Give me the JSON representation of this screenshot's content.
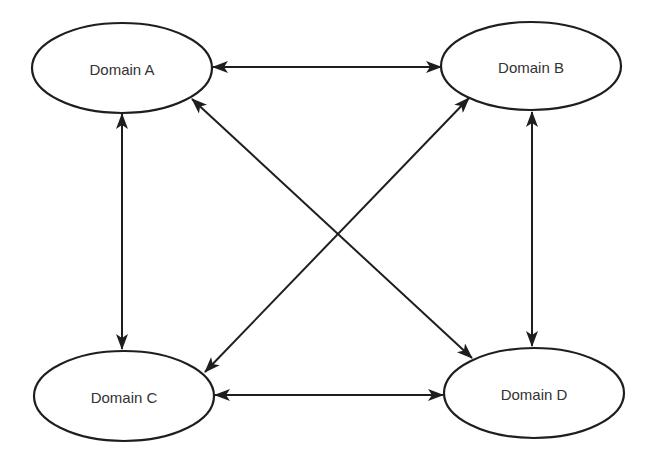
{
  "diagram": {
    "type": "bidirectional network",
    "nodes": [
      {
        "id": "A",
        "label": "Domain A",
        "cx": 122,
        "cy": 68,
        "rx": 90,
        "ry": 45
      },
      {
        "id": "B",
        "label": "Domain B",
        "cx": 531,
        "cy": 66,
        "rx": 90,
        "ry": 44
      },
      {
        "id": "C",
        "label": "Domain C",
        "cx": 124,
        "cy": 396,
        "rx": 90,
        "ry": 45
      },
      {
        "id": "D",
        "label": "Domain D",
        "cx": 534,
        "cy": 393,
        "rx": 90,
        "ry": 45
      }
    ],
    "edges": [
      {
        "from": "A",
        "to": "B",
        "direction": "both",
        "x1": 213,
        "y1": 67,
        "x2": 441,
        "y2": 67
      },
      {
        "from": "A",
        "to": "C",
        "direction": "both",
        "x1": 122,
        "y1": 114,
        "x2": 122,
        "y2": 349
      },
      {
        "from": "B",
        "to": "D",
        "direction": "both",
        "x1": 532,
        "y1": 112,
        "x2": 532,
        "y2": 346
      },
      {
        "from": "C",
        "to": "D",
        "direction": "both",
        "x1": 215,
        "y1": 395,
        "x2": 443,
        "y2": 395
      },
      {
        "from": "A",
        "to": "D",
        "direction": "both",
        "x1": 192,
        "y1": 99,
        "x2": 472,
        "y2": 358
      },
      {
        "from": "B",
        "to": "C",
        "direction": "both",
        "x1": 469,
        "y1": 98,
        "x2": 205,
        "y2": 372
      }
    ],
    "colors": {
      "stroke": "#1e1e1e",
      "text": "#333333",
      "background": "#ffffff"
    }
  }
}
